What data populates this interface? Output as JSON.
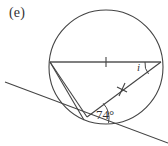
{
  "figure": {
    "part_label": "(e)",
    "angle_known_label": "74°",
    "angle_unknown_label": "i",
    "stroke_color": "#444444",
    "background_color": "#ffffff",
    "text_color": "#333333"
  },
  "geometry": {
    "circle": {
      "cx": 106,
      "cy": 67,
      "r": 57
    },
    "points": {
      "chord_left": {
        "x": 50,
        "y": 62,
        "name": "A"
      },
      "chord_right": {
        "x": 161,
        "y": 62,
        "name": "B"
      },
      "tangent_point": {
        "x": 87,
        "y": 117,
        "name": "T"
      }
    },
    "tangent_line": {
      "x1": 5,
      "y1": 82,
      "x2": 168,
      "y2": 143
    },
    "segments": [
      {
        "name": "horizontal-chord",
        "x1": 50,
        "y1": 62,
        "x2": 161,
        "y2": 62,
        "tick": 1
      },
      {
        "name": "chord-right-to-tangent",
        "x1": 161,
        "y1": 62,
        "x2": 87,
        "y2": 117,
        "tick": 1
      },
      {
        "name": "chord-left-to-tangent",
        "x1": 50,
        "y1": 62,
        "x2": 87,
        "y2": 117,
        "tick": 0
      },
      {
        "name": "arc-chord-left-lower",
        "x1": 50,
        "y1": 62,
        "x2": 84,
        "y2": 120,
        "tick": 0
      }
    ],
    "tick_marks": [
      {
        "name": "tick-horizontal-chord",
        "x": 106,
        "y": 62,
        "angle": 90
      },
      {
        "name": "tick-diagonal-chord",
        "x": 122,
        "y": 89,
        "angle": 53
      }
    ],
    "angle_arcs": [
      {
        "name": "angle-arc-74",
        "cx": 87,
        "cy": 117,
        "r": 22
      },
      {
        "name": "angle-arc-i",
        "cx": 161,
        "cy": 62,
        "r": 16
      }
    ]
  }
}
